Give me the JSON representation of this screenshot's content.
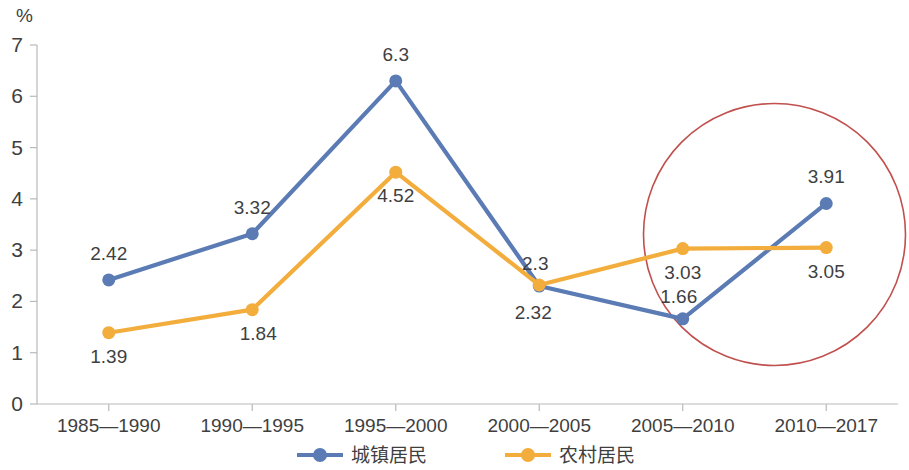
{
  "chart_data": {
    "type": "line",
    "title": "",
    "subtitle": "",
    "xlabel": "",
    "ylabel": "",
    "unit_label": "%",
    "ylim": [
      0,
      7
    ],
    "y_ticks": [
      "0",
      "1",
      "2",
      "3",
      "4",
      "5",
      "6",
      "7"
    ],
    "grid": false,
    "legend_position": "bottom",
    "categories": [
      "1985—1990",
      "1990—1995",
      "1995—2000",
      "2000—2005",
      "2005—2010",
      "2010—2017"
    ],
    "series": [
      {
        "name": "城镇居民",
        "color": "#5B7BB4",
        "values": [
          2.42,
          3.32,
          6.3,
          2.3,
          1.66,
          3.91
        ],
        "labels": [
          "2.42",
          "3.32",
          "6.3",
          "2.3",
          "1.66",
          "3.91"
        ]
      },
      {
        "name": "农村居民",
        "color": "#F2AD3C",
        "values": [
          1.39,
          1.84,
          4.52,
          2.32,
          3.03,
          3.05
        ],
        "labels": [
          "1.39",
          "1.84",
          "4.52",
          "2.32",
          "3.03",
          "3.05"
        ]
      }
    ],
    "annotations": [
      {
        "type": "circle",
        "color": "#C0504D",
        "covers": [
          "2005—2010",
          "2010—2017"
        ]
      }
    ]
  },
  "colors": {
    "urban": "#5B7BB4",
    "rural": "#F2AD3C",
    "annotation": "#C0504D",
    "axis": "#b9b9b9",
    "text": "#3f3f3f",
    "background": "#ffffff"
  },
  "legend": {
    "items": [
      {
        "label": "城镇居民",
        "color": "#5B7BB4"
      },
      {
        "label": "农村居民",
        "color": "#F2AD3C"
      }
    ]
  }
}
